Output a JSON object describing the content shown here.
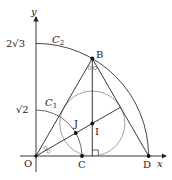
{
  "diagram": {
    "type": "geometry",
    "axes": {
      "x_label": "x",
      "y_label": "y"
    },
    "tick_labels": {
      "y_high": "2√3",
      "y_low": "√2"
    },
    "points": {
      "O": {
        "label": "O",
        "coords": [
          0,
          0
        ]
      },
      "B": {
        "label": "B",
        "coords": [
          "√3",
          3
        ]
      },
      "C": {
        "label": "C",
        "coords": [
          "√2",
          0
        ]
      },
      "D": {
        "label": "D",
        "coords": [
          "2√3",
          0
        ]
      },
      "I": {
        "label": "I",
        "coords": [
          "√3",
          1
        ]
      },
      "J": {
        "label": "J"
      }
    },
    "curves": {
      "C1": {
        "label": "C",
        "sub": "1",
        "center": "O",
        "radius": "√2"
      },
      "C2": {
        "label": "C",
        "sub": "2",
        "center": "O",
        "radius": "2√3"
      }
    },
    "incircle": {
      "center": "I",
      "radius": 1
    },
    "angle_marks": {
      "at_O": "○ ○",
      "at_B": "○ ○"
    },
    "right_angle_mark": "foot of perpendicular from B on x-axis",
    "colors": {
      "line": "#222222",
      "circle": "#777777"
    }
  }
}
